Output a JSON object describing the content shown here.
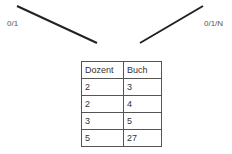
{
  "connectors": {
    "left": {
      "label": "0/1",
      "x1": 17,
      "y1": 6,
      "x2": 97,
      "y2": 43
    },
    "right": {
      "label": "0/1/N",
      "x1": 140,
      "y1": 43,
      "x2": 203,
      "y2": 6
    },
    "color": "#222222"
  },
  "table": {
    "headers": [
      "Dozent",
      "Buch"
    ],
    "rows": [
      [
        "2",
        "3"
      ],
      [
        "2",
        "4"
      ],
      [
        "3",
        "5"
      ],
      [
        "5",
        "27"
      ]
    ]
  }
}
